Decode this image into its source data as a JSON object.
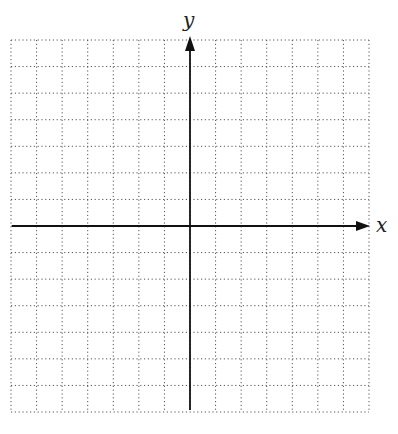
{
  "diagram": {
    "type": "coordinate-plane",
    "x_axis_label": "x",
    "y_axis_label": "y",
    "grid": {
      "units_left": 7,
      "units_right": 7,
      "units_up": 7,
      "units_down": 7,
      "line_style": "dotted",
      "line_color": "#555555"
    },
    "axis_color": "#111111",
    "tick_labels": []
  }
}
